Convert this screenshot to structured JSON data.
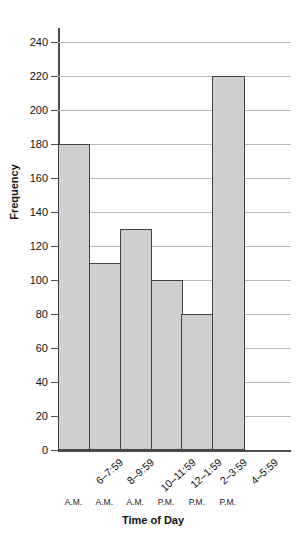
{
  "chart_data": {
    "type": "bar",
    "title": "",
    "xlabel": "Time of Day",
    "ylabel": "Frequency",
    "categories": [
      "6–7:59",
      "8–9:59",
      "10–11:59",
      "12–1:59",
      "2–3:59",
      "4–5:59"
    ],
    "category_meridiems": [
      "A.M.",
      "A.M.",
      "A.M.",
      "P.M.",
      "P.M.",
      "P.M."
    ],
    "values": [
      180,
      110,
      130,
      100,
      80,
      220
    ],
    "ylim": [
      0,
      240
    ],
    "ytick_step": 20,
    "yticks": [
      0,
      20,
      40,
      60,
      80,
      100,
      120,
      140,
      160,
      180,
      200,
      220,
      240
    ],
    "ytick_labels": [
      "0",
      "20",
      "40",
      "60",
      "80",
      "100",
      "120",
      "140",
      "160",
      "180",
      "200",
      "220",
      "240"
    ],
    "grid": true,
    "legend": false,
    "legend_position": "none",
    "bar_gap": 0,
    "colors": {
      "bar_fill": "#cfcfcf",
      "bar_border": "#414141",
      "gridline": "#b9b9b9",
      "axis": "#4c4c4c",
      "text": "#111111",
      "background": "#ffffff"
    }
  }
}
